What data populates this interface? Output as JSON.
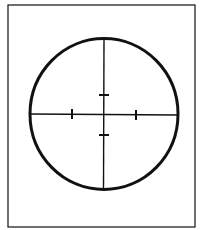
{
  "diagram": {
    "type": "reticle",
    "colors": {
      "background": "#ffffff",
      "stroke": "#111111"
    },
    "frame": {
      "x": 8,
      "y": 5,
      "width": 187,
      "height": 222,
      "stroke_width": 1.2
    },
    "circle": {
      "cx": 104,
      "cy": 114,
      "rx": 74,
      "ry": 75.5,
      "stroke_width": 3
    },
    "crosshair": {
      "horizontal": {
        "x1": 30,
        "y1": 114,
        "x2": 178,
        "y2": 115
      },
      "vertical": {
        "x1": 104,
        "y1": 38.5,
        "x2": 103.5,
        "y2": 189.5
      },
      "stroke_width": 1.4
    },
    "ticks": [
      {
        "name": "tick-left",
        "x1": 72,
        "y1": 109,
        "x2": 72,
        "y2": 119
      },
      {
        "name": "tick-right",
        "x1": 136,
        "y1": 110,
        "x2": 136,
        "y2": 120
      },
      {
        "name": "tick-top",
        "x1": 99,
        "y1": 95,
        "x2": 109,
        "y2": 95
      },
      {
        "name": "tick-bottom",
        "x1": 99,
        "y1": 135,
        "x2": 109,
        "y2": 135
      }
    ],
    "tick_stroke_width": 2
  }
}
